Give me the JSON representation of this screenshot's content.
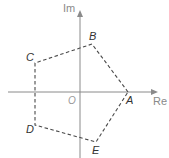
{
  "diagram": {
    "type": "argand-diagram",
    "axes": {
      "real_label": "Re",
      "imag_label": "Im",
      "origin_label": "O"
    },
    "polygon": {
      "style": "dashed",
      "vertices": [
        {
          "label": "A",
          "x": 128,
          "y": 92
        },
        {
          "label": "B",
          "x": 92,
          "y": 44
        },
        {
          "label": "C",
          "x": 35,
          "y": 63
        },
        {
          "label": "D",
          "x": 35,
          "y": 125
        },
        {
          "label": "E",
          "x": 96,
          "y": 142
        }
      ]
    },
    "colors": {
      "axis": "#8a8a8a",
      "polygon": "#4a4a4a",
      "labels": "#333333"
    }
  }
}
